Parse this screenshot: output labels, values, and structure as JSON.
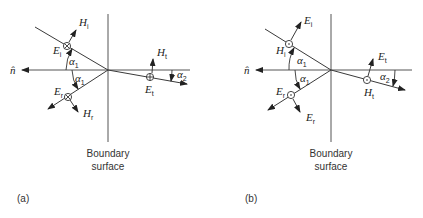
{
  "panels": [
    {
      "id": "a",
      "caption": "(a)",
      "normal_label": "n̂",
      "boundary_label_line1": "Boundary",
      "boundary_label_line2": "surface",
      "incident": {
        "e_symbol": "E",
        "e_sub": "i",
        "h_symbol": "H",
        "h_sub": "i",
        "e_polarization": "into-page"
      },
      "reflected": {
        "e_symbol": "E",
        "e_sub": "r",
        "h_symbol": "H",
        "h_sub": "r",
        "e_polarization": "into-page"
      },
      "transmitted": {
        "e_symbol": "E",
        "e_sub": "t",
        "h_symbol": "H",
        "h_sub": "t",
        "e_polarization": "into-page"
      },
      "angle_incident": "α",
      "angle_incident_sub": "1",
      "angle_reflected": "α",
      "angle_reflected_sub": "1",
      "angle_transmitted": "α",
      "angle_transmitted_sub": "2"
    },
    {
      "id": "b",
      "caption": "(b)",
      "normal_label": "n̂",
      "boundary_label_line1": "Boundary",
      "boundary_label_line2": "surface",
      "incident": {
        "e_symbol": "E",
        "e_sub": "i",
        "h_symbol": "H",
        "h_sub": "i",
        "h_polarization": "out-of-page"
      },
      "reflected": {
        "e_symbol": "E",
        "e_sub": "r",
        "h_symbol": "E",
        "h_sub": "r",
        "h_polarization": "out-of-page"
      },
      "transmitted": {
        "e_symbol": "E",
        "e_sub": "t",
        "h_symbol": "H",
        "h_sub": "t",
        "h_polarization": "out-of-page"
      },
      "angle_incident": "α",
      "angle_incident_sub": "1",
      "angle_reflected": "α",
      "angle_reflected_sub": "1",
      "angle_transmitted": "α",
      "angle_transmitted_sub": "2"
    }
  ]
}
